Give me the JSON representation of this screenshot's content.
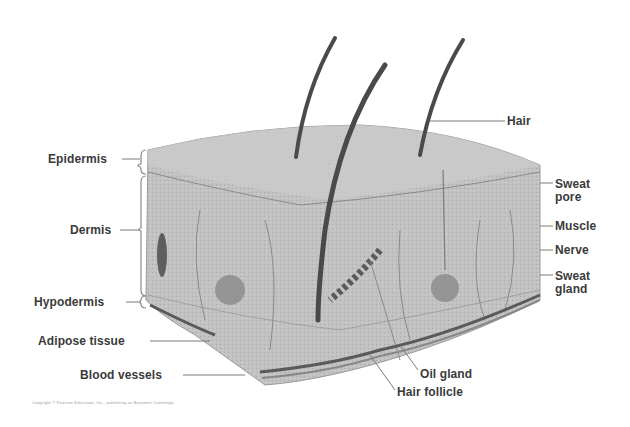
{
  "diagram": {
    "title": "",
    "colors": {
      "background": "#ffffff",
      "tissue": "#bdbdbd",
      "tissue_light": "#d6d6d6",
      "hair": "#4a4a4a",
      "leader_line": "#6e6e6e",
      "label_text": "#3a3a3a"
    },
    "labels_left": [
      {
        "id": "epidermis",
        "text": "Epidermis"
      },
      {
        "id": "dermis",
        "text": "Dermis"
      },
      {
        "id": "hypodermis",
        "text": "Hypodermis"
      },
      {
        "id": "adipose",
        "text": "Adipose tissue"
      },
      {
        "id": "blood-vessels",
        "text": "Blood vessels"
      }
    ],
    "labels_right": [
      {
        "id": "hair",
        "text": "Hair"
      },
      {
        "id": "sweat-pore",
        "text": "Sweat pore"
      },
      {
        "id": "muscle",
        "text": "Muscle"
      },
      {
        "id": "nerve",
        "text": "Nerve"
      },
      {
        "id": "sweat-gland",
        "text": "Sweat gland"
      }
    ],
    "labels_bottom": [
      {
        "id": "oil-gland",
        "text": "Oil gland"
      },
      {
        "id": "hair-follicle",
        "text": "Hair follicle"
      }
    ],
    "caption": "Copyright © Pearson Education, Inc., publishing as Benjamin Cummings"
  }
}
